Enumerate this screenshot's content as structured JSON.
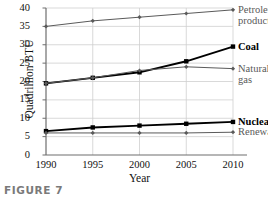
{
  "caption": "FIGURE 7",
  "chart_data": {
    "type": "line",
    "title": "",
    "xlabel": "Year",
    "ylabel": "Quadrillion BTU",
    "categories": [
      "1990",
      "1995",
      "2000",
      "2005",
      "2010"
    ],
    "x": [
      1990,
      1995,
      2000,
      2005,
      2010
    ],
    "xlim": [
      1990,
      2010
    ],
    "ylim": [
      0,
      40
    ],
    "yticks": [
      "0",
      "5",
      "10",
      "15",
      "20",
      "25",
      "30",
      "35",
      "40"
    ],
    "ytick_values": [
      0,
      5,
      10,
      15,
      20,
      25,
      30,
      35,
      40
    ],
    "xticks": [
      "1990",
      "1995",
      "2000",
      "2005",
      "2010"
    ],
    "grid": true,
    "legend_position": "right-inline",
    "series": [
      {
        "name": "Petroleum products",
        "label_line1": "Petroleum",
        "label_line2": "products",
        "values": [
          35.0,
          36.5,
          37.5,
          38.5,
          39.5
        ],
        "color": "#5a5a5a",
        "emphasis": "light",
        "marker": "diamond"
      },
      {
        "name": "Coal",
        "label_line1": "Coal",
        "label_line2": "",
        "values": [
          19.5,
          21.0,
          22.5,
          25.5,
          29.5
        ],
        "color": "#000000",
        "emphasis": "bold",
        "marker": "square"
      },
      {
        "name": "Natural gas",
        "label_line1": "Natural",
        "label_line2": "gas",
        "values": [
          19.5,
          21.0,
          23.0,
          24.0,
          23.5
        ],
        "color": "#5a5a5a",
        "emphasis": "light",
        "marker": "diamond"
      },
      {
        "name": "Nuclear",
        "label_line1": "Nuclear",
        "label_line2": "",
        "values": [
          6.5,
          7.5,
          8.0,
          8.5,
          9.0
        ],
        "color": "#000000",
        "emphasis": "bold",
        "marker": "square"
      },
      {
        "name": "Renewable",
        "label_line1": "Renewable",
        "label_line2": "",
        "values": [
          6.0,
          6.0,
          6.0,
          6.0,
          6.2
        ],
        "color": "#5a5a5a",
        "emphasis": "light",
        "marker": "diamond"
      }
    ]
  },
  "colors": {
    "axis": "#6e6e6e",
    "grid": "#cfcfcf",
    "dark_series": "#000000",
    "light_series": "#5a5a5a",
    "caption": "#7a7a7a"
  }
}
